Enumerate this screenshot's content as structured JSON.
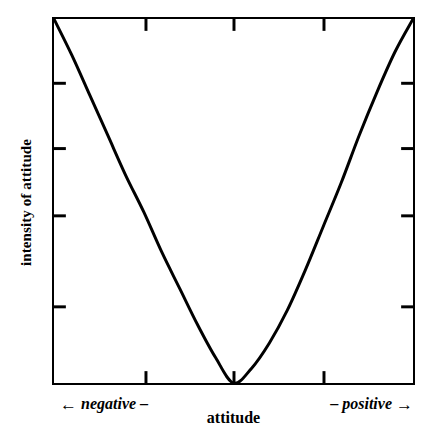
{
  "chart_data": {
    "type": "line",
    "title": "",
    "subtitle": "",
    "xlabel": "attitude",
    "ylabel": "intensity of attitude",
    "xlabel_left_end": "negative",
    "xlabel_right_end": "positive",
    "left_arrow": "←",
    "right_arrow": "→",
    "left_dash": "–",
    "right_dash": "–",
    "grid": false,
    "legend": null,
    "annotations": [],
    "xlim": [
      -1,
      1
    ],
    "ylim": [
      0,
      1
    ],
    "xtick_labels": [],
    "ytick_labels": [],
    "xticks": [
      -0.5,
      0,
      0.5
    ],
    "yticks": [
      0.21,
      0.48,
      0.65,
      0.82
    ],
    "series": [
      {
        "name": "intensity of attitude",
        "color": "#000000",
        "x": [
          -1.0,
          -0.9,
          -0.8,
          -0.7,
          -0.6,
          -0.5,
          -0.4,
          -0.3,
          -0.2,
          -0.1,
          0.0,
          0.1,
          0.2,
          0.3,
          0.4,
          0.5,
          0.6,
          0.7,
          0.8,
          0.9,
          1.0
        ],
        "y": [
          1.0,
          0.9,
          0.79,
          0.68,
          0.57,
          0.47,
          0.36,
          0.26,
          0.16,
          0.07,
          0.0,
          0.04,
          0.11,
          0.2,
          0.31,
          0.43,
          0.55,
          0.68,
          0.8,
          0.91,
          1.0
        ]
      }
    ]
  },
  "figure": {
    "background_color": "#ffffff",
    "frame_color": "#000000",
    "curve_color": "#000000"
  }
}
